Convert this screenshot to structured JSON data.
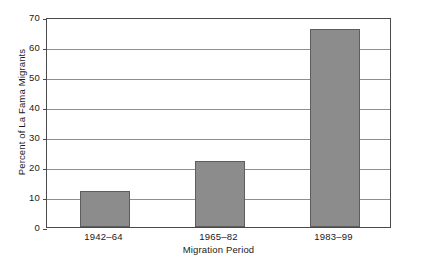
{
  "chart_data": {
    "type": "bar",
    "title": "",
    "subtitle": "",
    "xlabel": "Migration Period",
    "ylabel": "Percent of La Fama Migrants",
    "categories": [
      "1942–64",
      "1965–82",
      "1983–99"
    ],
    "values": [
      12,
      22,
      66
    ],
    "series": [
      {
        "name": "Percent of La Fama Migrants",
        "values": [
          12,
          22,
          66
        ]
      }
    ],
    "ylim": [
      0,
      70
    ],
    "yticks": [
      0,
      10,
      20,
      30,
      40,
      50,
      60,
      70
    ],
    "ytick_labels": [
      "0",
      "10",
      "20",
      "30",
      "40",
      "50",
      "60",
      "70"
    ],
    "grid": "horizontal",
    "legend": "none",
    "bar_color": "#8c8c8c",
    "bar_edge_color": "#5d5d5d",
    "axis_color": "#4a4a4a",
    "gridline_color": "#8e8e8e",
    "background_color": "#ffffff"
  }
}
